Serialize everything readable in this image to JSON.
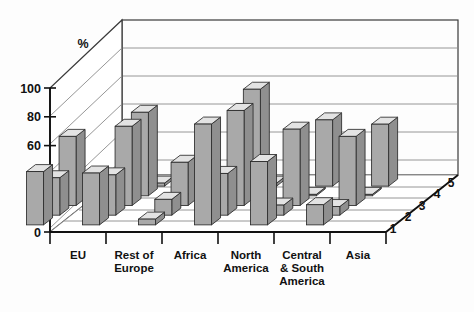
{
  "chart_data": {
    "type": "bar",
    "title": "",
    "subtitle": "",
    "xlabel": "",
    "ylabel": "%",
    "ylim": [
      0,
      110
    ],
    "yticks": [
      0,
      20,
      40,
      60,
      80,
      100
    ],
    "grid": true,
    "legend_position": "depth-axis",
    "three_d": true,
    "categories": [
      "EU",
      "Rest of\nEurope",
      "Africa",
      "North\nAmerica",
      "Central\n& South\nAmerica",
      "Asia"
    ],
    "category_labels": [
      [
        "EU"
      ],
      [
        "Rest of",
        "Europe"
      ],
      [
        "Africa"
      ],
      [
        "North",
        "America"
      ],
      [
        "Central",
        "& South",
        "America"
      ],
      [
        "Asia"
      ]
    ],
    "depth_axis_labels": [
      "1",
      "2",
      "3",
      "4",
      "5"
    ],
    "series": [
      {
        "name": "1",
        "depth": 1,
        "values": [
          37,
          36,
          4,
          70,
          44,
          14
        ]
      },
      {
        "name": "2",
        "depth": 2,
        "values": [
          26,
          28,
          11,
          29,
          7,
          6
        ]
      },
      {
        "name": "3",
        "depth": 3,
        "values": [
          48,
          55,
          30,
          66,
          53,
          48
        ]
      },
      {
        "name": "4",
        "depth": 4,
        "values": [
          0,
          58,
          1,
          74,
          1,
          1
        ]
      },
      {
        "name": "5",
        "depth": 5,
        "values": [
          0,
          0,
          0,
          0,
          46,
          43
        ]
      }
    ],
    "series_colors": [
      "#a9a9a9",
      "#a9a9a9",
      "#a9a9a9",
      "#a9a9a9",
      "#a9a9a9"
    ],
    "bar_face_color": "#a9a9a9",
    "bar_top_color": "#e3e3e3",
    "bar_side_color": "#8f8f8f",
    "bar_outline_color": "#2b2b2b",
    "background_color": "#fdfdfd",
    "gridline_color": "#8a8a8a",
    "axis_color": "#111111"
  }
}
